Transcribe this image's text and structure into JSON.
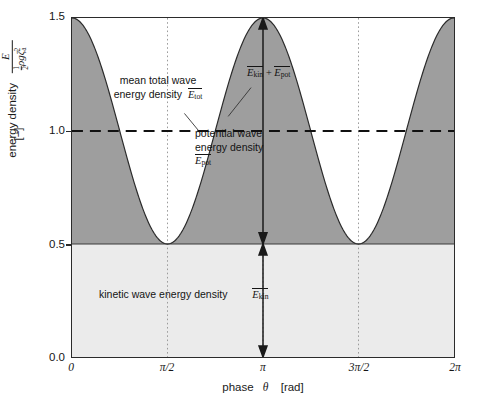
{
  "chart_data": {
    "type": "area",
    "title": "",
    "xlabel": "phase",
    "xsymbol": "θ",
    "xunit": "[rad]",
    "ylabel": "energy density",
    "yunit": "[−]",
    "yformula_num": "E",
    "yformula_den_frac_n": "1",
    "yformula_den_frac_d": "2",
    "yformula_den_rest": "ρgζ",
    "yformula_den_sub": "a",
    "yformula_den_pow": "2",
    "xlim": [
      0,
      6.283185
    ],
    "ylim": [
      0,
      1.5
    ],
    "xticks": [
      0,
      1.5708,
      3.14159,
      4.71239,
      6.28319
    ],
    "xticklabels": [
      "0",
      "π/2",
      "π",
      "3π/2",
      "2π"
    ],
    "yticks": [
      0.0,
      0.5,
      1.0,
      1.5
    ],
    "yticklabels": [
      "0.0",
      "0.5",
      "1.0",
      "1.5"
    ],
    "grid": "vertical dotted at pi/2, pi, 3pi/2",
    "legend": "none",
    "series": [
      {
        "name": "kinetic wave energy density",
        "symbol": "E_kin",
        "kind": "constant-band",
        "value": 0.5,
        "fill": "#ebebeb",
        "description": "constant 0.5 for all phase"
      },
      {
        "name": "total wave energy density",
        "symbol": "E_kin + E_pot",
        "kind": "curve",
        "formula": "1.0 + 0.5*cos(2*theta)",
        "fill": "#9e9e9e",
        "ymin": 0.5,
        "ymax": 1.5,
        "points_theta": [
          0,
          0.3927,
          0.7854,
          1.1781,
          1.5708,
          1.9635,
          2.3562,
          2.7489,
          3.14159,
          3.5343,
          3.927,
          4.3197,
          4.71239,
          5.1051,
          5.4978,
          5.8905,
          6.28319
        ],
        "points_value": [
          1.5,
          1.3536,
          1.0,
          0.6464,
          0.5,
          0.6464,
          1.0,
          1.3536,
          1.5,
          1.3536,
          1.0,
          0.6464,
          0.5,
          0.6464,
          1.0,
          1.3536,
          1.5
        ]
      },
      {
        "name": "mean total wave energy density",
        "symbol": "E_tot",
        "kind": "dashed-line",
        "value": 1.0,
        "color": "#111111"
      }
    ],
    "annotations": [
      {
        "id": "mean-total",
        "line1": "mean total wave",
        "line2": "energy density",
        "symbol": "E_tot"
      },
      {
        "id": "total-curve",
        "symbol": "E_kin + E_pot"
      },
      {
        "id": "potential",
        "line1": "potential wave",
        "line2": "energy density",
        "symbol": "E_pot"
      },
      {
        "id": "kinetic",
        "line1": "kinetic wave energy density",
        "symbol": "E_kin"
      }
    ],
    "arrows": [
      {
        "id": "potential-arrow",
        "theta": 3.14159,
        "from": 0.5,
        "to": 1.5,
        "style": "double-headed"
      },
      {
        "id": "kinetic-arrow",
        "theta": 3.14159,
        "from": 0.0,
        "to": 0.5,
        "style": "double-headed"
      }
    ]
  },
  "axes": {
    "yticks": [
      "1.5",
      "1.0",
      "0.5",
      "0.0"
    ],
    "xticks": [
      "0",
      "π/2",
      "π",
      "3π/2",
      "2π"
    ],
    "ylabel_text": "energy density",
    "yunit": "[−]",
    "xlabel_text": "phase",
    "xlabel_symbol": "θ",
    "xlabel_unit": "[rad]"
  },
  "labels": {
    "mean_total_l1": "mean total wave",
    "mean_total_l2": "energy density",
    "mean_total_sym_e": "E",
    "mean_total_sym_sub": "tot",
    "total_sym_e1": "E",
    "total_sym_sub1": "kin",
    "total_plus": "+",
    "total_sym_e2": "E",
    "total_sym_sub2": "pot",
    "potential_l1": "potential wave",
    "potential_l2": "energy density",
    "potential_sym_e": "E",
    "potential_sym_sub": "pot",
    "kinetic_l1": "kinetic wave energy density",
    "kinetic_sym_e": "E",
    "kinetic_sym_sub": "kin"
  },
  "colors": {
    "potential_fill": "#9e9e9e",
    "kinetic_fill": "#ebebeb",
    "frame": "#2b2b2b",
    "mean_line": "#111111",
    "gridline": "#9a9a9a"
  }
}
